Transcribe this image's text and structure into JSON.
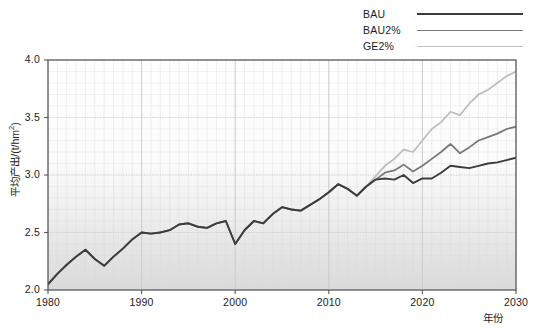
{
  "chart_data": {
    "type": "line",
    "title": "",
    "xlabel": "年份",
    "ylabel": "平均产出/(t/hm2)",
    "ylabel_unit_base": "平均产出/(t/hm",
    "ylabel_unit_sup": "2",
    "ylabel_unit_tail": ")",
    "xlim": [
      1980,
      2030
    ],
    "ylim": [
      2.0,
      4.0
    ],
    "yticks": [
      "2.0",
      "2.5",
      "3.0",
      "3.5",
      "4.0"
    ],
    "ytick_values": [
      2.0,
      2.5,
      3.0,
      3.5,
      4.0
    ],
    "xticks": [
      "1980",
      "1990",
      "2000",
      "2010",
      "2020",
      "2030"
    ],
    "xtick_values": [
      1980,
      1990,
      2000,
      2010,
      2020,
      2030
    ],
    "grid": true,
    "grid_minor": true,
    "legend_position": "top-right",
    "x": [
      1980,
      1981,
      1982,
      1983,
      1984,
      1985,
      1986,
      1987,
      1988,
      1989,
      1990,
      1991,
      1992,
      1993,
      1994,
      1995,
      1996,
      1997,
      1998,
      1999,
      2000,
      2001,
      2002,
      2003,
      2004,
      2005,
      2006,
      2007,
      2008,
      2009,
      2010,
      2011,
      2012,
      2013,
      2014,
      2015,
      2016,
      2017,
      2018,
      2019,
      2020,
      2021,
      2022,
      2023,
      2024,
      2025,
      2026,
      2027,
      2028,
      2029,
      2030
    ],
    "series": [
      {
        "name": "BAU",
        "color": "#3c3c3c",
        "width": 1.9,
        "values": [
          2.05,
          2.14,
          2.22,
          2.29,
          2.35,
          2.27,
          2.21,
          2.29,
          2.36,
          2.44,
          2.5,
          2.49,
          2.5,
          2.52,
          2.57,
          2.58,
          2.55,
          2.54,
          2.58,
          2.6,
          2.4,
          2.52,
          2.6,
          2.58,
          2.66,
          2.72,
          2.7,
          2.69,
          2.74,
          2.79,
          2.85,
          2.92,
          2.88,
          2.82,
          2.9,
          2.96,
          2.97,
          2.96,
          3.0,
          2.93,
          2.97,
          2.97,
          3.02,
          3.08,
          3.07,
          3.06,
          3.08,
          3.1,
          3.11,
          3.13,
          3.15
        ]
      },
      {
        "name": "BAU2%",
        "color": "#787878",
        "width": 1.8,
        "values": [
          2.05,
          2.14,
          2.22,
          2.29,
          2.35,
          2.27,
          2.21,
          2.29,
          2.36,
          2.44,
          2.5,
          2.49,
          2.5,
          2.52,
          2.57,
          2.58,
          2.55,
          2.54,
          2.58,
          2.6,
          2.4,
          2.52,
          2.6,
          2.58,
          2.66,
          2.72,
          2.7,
          2.69,
          2.74,
          2.79,
          2.85,
          2.92,
          2.88,
          2.82,
          2.9,
          2.96,
          3.02,
          3.04,
          3.09,
          3.03,
          3.08,
          3.14,
          3.2,
          3.27,
          3.19,
          3.24,
          3.3,
          3.33,
          3.36,
          3.4,
          3.42
        ]
      },
      {
        "name": "GE2%",
        "color": "#bdbdbd",
        "width": 1.8,
        "values": [
          2.05,
          2.14,
          2.22,
          2.29,
          2.35,
          2.27,
          2.21,
          2.29,
          2.36,
          2.44,
          2.5,
          2.49,
          2.5,
          2.52,
          2.57,
          2.58,
          2.55,
          2.54,
          2.58,
          2.6,
          2.4,
          2.52,
          2.6,
          2.58,
          2.66,
          2.72,
          2.7,
          2.69,
          2.74,
          2.79,
          2.85,
          2.92,
          2.88,
          2.82,
          2.9,
          2.99,
          3.08,
          3.14,
          3.22,
          3.2,
          3.3,
          3.4,
          3.46,
          3.55,
          3.52,
          3.62,
          3.7,
          3.74,
          3.8,
          3.86,
          3.9
        ]
      }
    ]
  },
  "legend": {
    "items": [
      {
        "label": "BAU",
        "color": "#3c3c3c",
        "width": 2.0
      },
      {
        "label": "BAU2%",
        "color": "#787878",
        "width": 1.6
      },
      {
        "label": "GE2%",
        "color": "#bdbdbd",
        "width": 1.6
      }
    ]
  },
  "colors": {
    "axis": "#5a5a5a",
    "grid_major": "#c8c8c8",
    "grid_minor": "#dcdcdc",
    "plot_bg_top": "#ffffff",
    "plot_bg_bottom": "#dedede",
    "text": "#1c1c1c"
  }
}
